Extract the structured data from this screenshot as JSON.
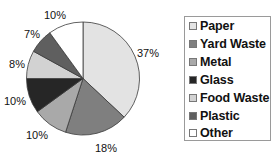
{
  "chart_data": {
    "type": "pie",
    "title": "",
    "categories": [
      "Paper",
      "Yard Waste",
      "Metal",
      "Glass",
      "Food Waste",
      "Plastic",
      "Other"
    ],
    "values": [
      37,
      18,
      10,
      10,
      8,
      7,
      10
    ],
    "labels": [
      "37%",
      "18%",
      "10%",
      "10%",
      "8%",
      "7%",
      "10%"
    ],
    "colors": [
      "#e3e3e3",
      "#7f7f7f",
      "#a9a9a9",
      "#262626",
      "#d2d2d2",
      "#5f5f5f",
      "#ffffff"
    ],
    "start_angle": "12 o'clock",
    "direction": "clockwise",
    "legend_position": "right"
  },
  "legend": {
    "items": [
      {
        "label": "Paper",
        "color": "#e3e3e3"
      },
      {
        "label": "Yard Waste",
        "color": "#7f7f7f"
      },
      {
        "label": "Metal",
        "color": "#a9a9a9"
      },
      {
        "label": "Glass",
        "color": "#262626"
      },
      {
        "label": "Food Waste",
        "color": "#d2d2d2"
      },
      {
        "label": "Plastic",
        "color": "#5f5f5f"
      },
      {
        "label": "Other",
        "color": "#ffffff"
      }
    ]
  }
}
